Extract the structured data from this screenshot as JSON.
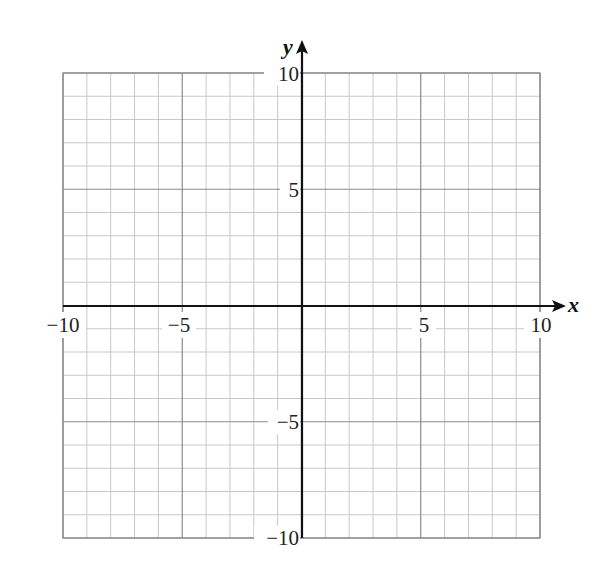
{
  "chart_data": {
    "type": "scatter",
    "title": "",
    "xlabel": "x",
    "ylabel": "y",
    "xlim": [
      -10,
      10
    ],
    "ylim": [
      -10,
      10
    ],
    "grid": true,
    "grid_minor_step": 1,
    "grid_major_step": 5,
    "x_ticks": [
      "−10",
      "−5",
      "5",
      "10"
    ],
    "y_ticks": [
      "10",
      "5",
      "−5",
      "−10"
    ],
    "series": []
  },
  "labels": {
    "x_axis": "x",
    "y_axis": "y",
    "x_neg10": "−10",
    "x_neg5": "−5",
    "x_5": "5",
    "x_10": "10",
    "y_10": "10",
    "y_5": "5",
    "y_neg5": "−5",
    "y_neg10": "−10"
  },
  "colors": {
    "minor_grid": "#c8c8c8",
    "major_grid": "#8a8a8a",
    "axis": "#111111"
  }
}
